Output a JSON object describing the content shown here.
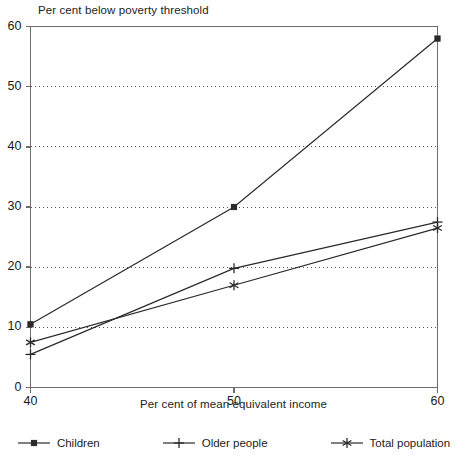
{
  "chart_data": {
    "type": "line",
    "title": "Per cent below poverty threshold",
    "xlabel": "Per cent of mean equivalent income",
    "ylabel": "",
    "x": [
      40,
      50,
      60
    ],
    "xlim": [
      40,
      60
    ],
    "ylim": [
      0,
      60
    ],
    "xticks": [
      40,
      50,
      60
    ],
    "xtick_labels": [
      "40",
      "50",
      "60"
    ],
    "yticks": [
      0,
      10,
      20,
      30,
      40,
      50,
      60
    ],
    "ytick_labels": [
      "0",
      "10",
      "20",
      "30",
      "40",
      "50",
      "60"
    ],
    "grid": "horizontal-dotted",
    "legend_position": "bottom",
    "series": [
      {
        "name": "Children",
        "marker": "square",
        "color": "#2a2a2a",
        "values": [
          10.5,
          30.0,
          58.0
        ]
      },
      {
        "name": "Older people",
        "marker": "plus",
        "color": "#2a2a2a",
        "values": [
          5.5,
          19.8,
          27.5
        ]
      },
      {
        "name": "Total population",
        "marker": "asterisk",
        "color": "#2a2a2a",
        "values": [
          7.5,
          17.0,
          26.5
        ]
      }
    ]
  },
  "legend": {
    "items": [
      {
        "label": "Children",
        "marker": "square-marker-icon"
      },
      {
        "label": "Older people",
        "marker": "plus-marker-icon"
      },
      {
        "label": "Total population",
        "marker": "asterisk-marker-icon"
      }
    ]
  },
  "axes": {
    "x_title": "Per cent of mean equivalent income",
    "y_title": "Per cent below poverty threshold"
  }
}
